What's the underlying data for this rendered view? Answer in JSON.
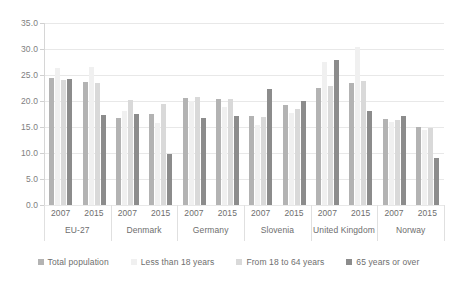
{
  "chart_data": {
    "type": "bar",
    "title": "",
    "xlabel": "",
    "ylabel": "",
    "ylim": [
      0,
      35
    ],
    "ytick_step": 5,
    "grid": true,
    "legend_position": "bottom",
    "ytick_labels": [
      "35.0",
      "30.0",
      "25.0",
      "20.0",
      "15.0",
      "10.0",
      "5.0",
      "0.0"
    ],
    "ytick_values": [
      35,
      30,
      25,
      20,
      15,
      10,
      5,
      0
    ],
    "groups": [
      "EU-27",
      "Denmark",
      "Germany",
      "Slovenia",
      "United Kingdom",
      "Norway"
    ],
    "years": [
      "2007",
      "2015"
    ],
    "categories": [
      "EU-27 2007",
      "EU-27 2015",
      "Denmark 2007",
      "Denmark 2015",
      "Germany 2007",
      "Germany 2015",
      "Slovenia 2007",
      "Slovenia 2015",
      "United Kingdom 2007",
      "United Kingdom 2015",
      "Norway 2007",
      "Norway 2015"
    ],
    "series": [
      {
        "name": "Total population",
        "color": "#b3b3b3",
        "values": [
          24.4,
          23.7,
          16.8,
          17.6,
          20.6,
          20.3,
          17.1,
          19.2,
          22.6,
          23.5,
          16.5,
          15.0
        ]
      },
      {
        "name": "Less than 18 years",
        "color": "#f0f0f0",
        "values": [
          26.4,
          26.6,
          18.1,
          15.7,
          20.1,
          18.8,
          15.3,
          17.7,
          27.6,
          30.3,
          15.9,
          14.5
        ]
      },
      {
        "name": "From 18 to 64 years",
        "color": "#d9d9d9",
        "values": [
          24.0,
          23.4,
          20.2,
          19.4,
          20.8,
          20.4,
          17.0,
          18.5,
          22.8,
          23.9,
          16.4,
          14.9
        ]
      },
      {
        "name": "65 years or over",
        "color": "#8c8c8c",
        "values": [
          24.3,
          17.4,
          17.5,
          9.9,
          16.8,
          17.2,
          22.4,
          20.0,
          27.9,
          18.1,
          17.1,
          9.1
        ]
      }
    ]
  },
  "legend": {
    "items": [
      {
        "label": "Total population",
        "color": "#b3b3b3"
      },
      {
        "label": "Less than 18 years",
        "color": "#f0f0f0"
      },
      {
        "label": "From 18 to 64 years",
        "color": "#d9d9d9"
      },
      {
        "label": "65 years or over",
        "color": "#8c8c8c"
      }
    ]
  }
}
